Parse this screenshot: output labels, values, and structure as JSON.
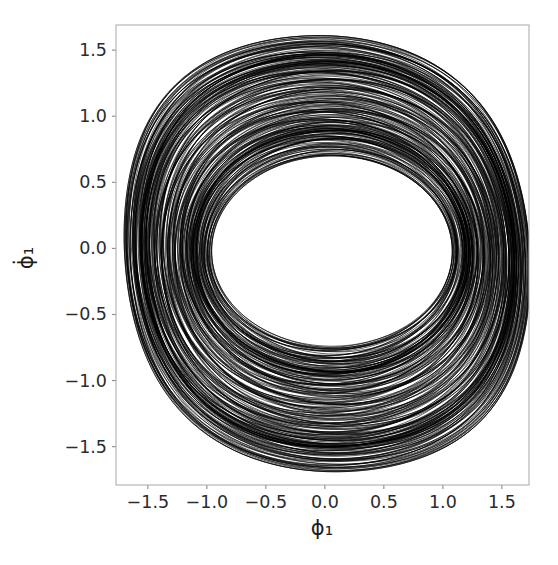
{
  "figure": {
    "background_color": "#ffffff",
    "frame_color": "#b0b0b0",
    "trace_color": "#000000"
  },
  "axes": {
    "x_label": "ϕ₁",
    "y_label": "ϕ̇₁",
    "x_ticks": [
      "−1.5",
      "−1.0",
      "−0.5",
      "0.0",
      "0.5",
      "1.0",
      "1.5"
    ],
    "y_ticks": [
      "1.5",
      "1.0",
      "0.5",
      "0.0",
      "−0.5",
      "−1.0",
      "−1.5"
    ]
  },
  "chart_data": {
    "type": "line",
    "title": "",
    "xlabel": "ϕ₁",
    "ylabel": "ϕ̇₁",
    "xlim": [
      -1.77,
      1.73
    ],
    "ylim": [
      -1.79,
      1.69
    ],
    "xticks": [
      -1.5,
      -1.0,
      -0.5,
      0.0,
      0.5,
      1.0,
      1.5
    ],
    "yticks": [
      -1.5,
      -1.0,
      -0.5,
      0.0,
      0.5,
      1.0,
      1.5
    ],
    "grid": false,
    "legend": null,
    "series": [
      {
        "name": "trajectory",
        "color": "#000000",
        "linewidth": 0.6,
        "model": "quasiperiodic-annulus",
        "params": {
          "center_x": 0.02,
          "center_y": -0.04,
          "outer_radius_x": 1.72,
          "outer_radius_y": 1.65,
          "inner_radius_x": 1.02,
          "inner_radius_y": 0.72,
          "inner_center_x": 0.06,
          "inner_center_y": -0.02,
          "carrier_frequency": 1.0,
          "modulation_frequency": 0.1316,
          "modulation_depth": 0.33,
          "secondary_modulation": 0.09,
          "shape_skew": 0.11,
          "revolutions": 240,
          "samples": 32000
        }
      }
    ],
    "annulus": {
      "outer_extent_x": [
        -1.62,
        1.6
      ],
      "outer_extent_y": [
        -1.68,
        1.58
      ],
      "hole_extent_x": [
        -0.95,
        0.92
      ],
      "hole_extent_y": [
        -0.62,
        0.62
      ]
    }
  }
}
